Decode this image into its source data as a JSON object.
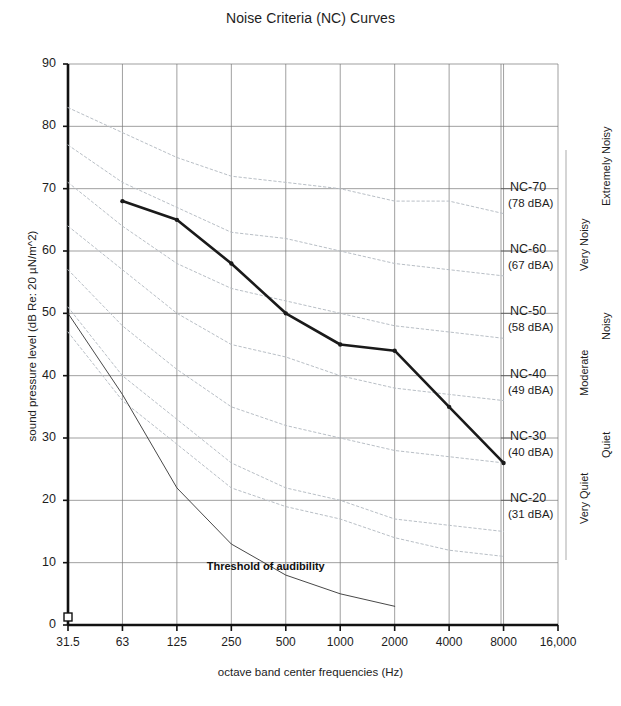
{
  "chart_data": {
    "type": "line",
    "title": "Noise Criteria (NC) Curves",
    "xlabel": "octave band center frequencies (Hz)",
    "ylabel": "sound pressure level (dB Re: 20 µN/m^2)",
    "grid": true,
    "legend_position": "right-annotations",
    "xticklabels": [
      "31.5",
      "63",
      "125",
      "250",
      "500",
      "1000",
      "2000",
      "4000",
      "8000",
      "16,000"
    ],
    "x_values": [
      31.5,
      63,
      125,
      250,
      500,
      1000,
      2000,
      4000,
      8000,
      16000
    ],
    "yticklabels": [
      "0",
      "10",
      "20",
      "30",
      "40",
      "50",
      "60",
      "70",
      "80",
      "90"
    ],
    "ylim": [
      0,
      90
    ],
    "ytick_step": 10,
    "series": [
      {
        "name": "Measured spectrum",
        "style": "bold-solid-with-markers",
        "color": "#1a1a1a",
        "x": [
          63,
          125,
          250,
          500,
          1000,
          2000,
          4000,
          8000
        ],
        "values": [
          68,
          65,
          58,
          50,
          45,
          44,
          35,
          26
        ]
      },
      {
        "name": "Threshold of audibility",
        "style": "thin-solid",
        "color": "#333333",
        "x": [
          31.5,
          63,
          125,
          250,
          500,
          1000,
          2000
        ],
        "values": [
          50,
          37,
          22,
          13,
          8,
          5,
          3
        ]
      },
      {
        "name": "NC-70",
        "style": "dotted-gray",
        "color": "#b9bfc6",
        "x": [
          31.5,
          63,
          125,
          250,
          500,
          1000,
          2000,
          4000,
          8000
        ],
        "values": [
          83,
          79,
          75,
          72,
          71,
          70,
          68,
          68,
          66
        ]
      },
      {
        "name": "NC-60",
        "style": "dotted-gray",
        "color": "#b9bfc6",
        "x": [
          31.5,
          63,
          125,
          250,
          500,
          1000,
          2000,
          4000,
          8000
        ],
        "values": [
          77,
          71,
          67,
          63,
          62,
          60,
          58,
          57,
          56
        ]
      },
      {
        "name": "NC-50",
        "style": "dotted-gray",
        "color": "#b9bfc6",
        "x": [
          31.5,
          63,
          125,
          250,
          500,
          1000,
          2000,
          4000,
          8000
        ],
        "values": [
          71,
          64,
          58,
          54,
          52,
          50,
          48,
          47,
          46
        ]
      },
      {
        "name": "NC-40",
        "style": "dotted-gray",
        "color": "#b9bfc6",
        "x": [
          31.5,
          63,
          125,
          250,
          500,
          1000,
          2000,
          4000,
          8000
        ],
        "values": [
          64,
          57,
          50,
          45,
          43,
          40,
          38,
          37,
          36
        ]
      },
      {
        "name": "NC-30",
        "style": "dotted-gray",
        "color": "#b9bfc6",
        "x": [
          31.5,
          63,
          125,
          250,
          500,
          1000,
          2000,
          4000,
          8000
        ],
        "values": [
          57,
          48,
          41,
          35,
          32,
          30,
          28,
          27,
          26
        ]
      },
      {
        "name": "NC-20",
        "style": "dotted-gray",
        "color": "#b9bfc6",
        "x": [
          31.5,
          63,
          125,
          250,
          500,
          1000,
          2000,
          4000,
          8000
        ],
        "values": [
          51,
          40,
          33,
          26,
          22,
          20,
          17,
          16,
          15
        ]
      },
      {
        "name": "NC-15",
        "style": "dotted-gray",
        "color": "#b9bfc6",
        "x": [
          31.5,
          63,
          125,
          250,
          500,
          1000,
          2000,
          4000,
          8000
        ],
        "values": [
          47,
          36,
          29,
          22,
          19,
          17,
          14,
          12,
          11
        ]
      }
    ],
    "annotations": [
      {
        "text": "Threshold of audibility",
        "x": 500,
        "y": 9
      }
    ],
    "nc_markers": [
      {
        "label": "NC-70",
        "sub": "(78 dBA)",
        "level": 70
      },
      {
        "label": "NC-60",
        "sub": "(67 dBA)",
        "level": 60
      },
      {
        "label": "NC-50",
        "sub": "(58 dBA)",
        "level": 50
      },
      {
        "label": "NC-40",
        "sub": "(49 dBA)",
        "level": 40
      },
      {
        "label": "NC-30",
        "sub": "(40 dBA)",
        "level": 30
      },
      {
        "label": "NC-20",
        "sub": "(31 dBA)",
        "level": 20
      }
    ],
    "category_bands": [
      {
        "label": "Extremely Noisy",
        "top": 63,
        "bottom": 85
      },
      {
        "label": "Very Noisy",
        "top": 57,
        "bottom": 70
      },
      {
        "label": "Noisy",
        "top": 47,
        "bottom": 58
      },
      {
        "label": "Moderate",
        "top": 37,
        "bottom": 50
      },
      {
        "label": "Quiet",
        "top": 27,
        "bottom": 40
      },
      {
        "label": "Very Quiet",
        "top": 16,
        "bottom": 30
      }
    ]
  }
}
